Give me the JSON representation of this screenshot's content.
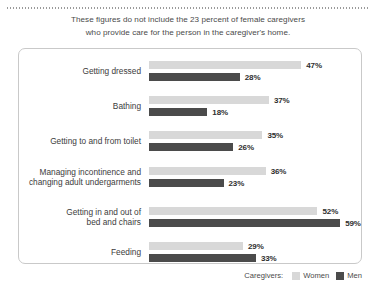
{
  "header": {
    "line1": "These figures do not include the 23 percent of female caregivers",
    "line2": "who provide care for the person in the caregiver's home."
  },
  "legend": {
    "title": "Caregivers:",
    "items": [
      {
        "label": "Women",
        "color": "#d8d8d8"
      },
      {
        "label": "Men",
        "color": "#4b4b4b"
      }
    ]
  },
  "chart_data": {
    "type": "bar",
    "orientation": "horizontal",
    "title": "",
    "subtitle": "",
    "xlabel": "",
    "ylabel": "",
    "xlim": [
      0,
      65
    ],
    "grid": false,
    "legend_position": "bottom-right",
    "value_suffix": "%",
    "categories": [
      "Getting dressed",
      "Bathing",
      "Getting to and from toilet",
      "Managing incontinence and changing adult undergarments",
      "Getting in and out of bed and chairs",
      "Feeding"
    ],
    "category_lines": [
      [
        "Getting dressed"
      ],
      [
        "Bathing"
      ],
      [
        "Getting to and from toilet"
      ],
      [
        "Managing incontinence and",
        "changing adult undergarments"
      ],
      [
        "Getting in and out of",
        "bed and chairs"
      ],
      [
        "Feeding"
      ]
    ],
    "series": [
      {
        "name": "Women",
        "color": "#d8d8d8",
        "values": [
          47,
          37,
          35,
          36,
          52,
          29
        ],
        "labels": [
          "47%",
          "37%",
          "35%",
          "36%",
          "52%",
          "29%"
        ]
      },
      {
        "name": "Men",
        "color": "#4b4b4b",
        "values": [
          28,
          18,
          26,
          23,
          59,
          33
        ],
        "labels": [
          "28%",
          "18%",
          "26%",
          "23%",
          "59%",
          "33%"
        ]
      }
    ]
  }
}
